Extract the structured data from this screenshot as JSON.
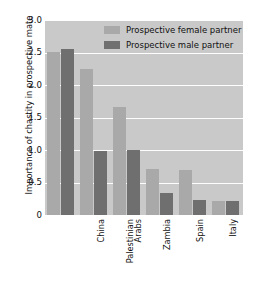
{
  "chart_data": {
    "type": "bar",
    "title": "",
    "xlabel": "",
    "ylabel": "Importance of chastity in prospective mate",
    "ylim": [
      0,
      3.0
    ],
    "yticks": [
      "0",
      "0.5",
      "1.0",
      "1.5",
      "2.0",
      "2.5",
      "3.0"
    ],
    "ytick_values": [
      0,
      0.5,
      1.0,
      1.5,
      2.0,
      2.5,
      3.0
    ],
    "grid": true,
    "legend_position": "top-right-inside",
    "categories": [
      "China",
      "Palestinian Arabs",
      "Zambia",
      "Spain",
      "Italy",
      "Netherlands"
    ],
    "series": [
      {
        "name": "Prospective female partner",
        "color": "#a9a9a9",
        "values": [
          2.51,
          2.24,
          1.66,
          0.71,
          0.7,
          0.22
        ]
      },
      {
        "name": "Prospective male partner",
        "color": "#6f6f6f",
        "values": [
          2.56,
          0.99,
          1.0,
          0.34,
          0.23,
          0.22
        ]
      }
    ],
    "plot_background": "#c9c9c9",
    "gridline_color": "#fdfdfd",
    "figure_background": "#ffffff"
  }
}
